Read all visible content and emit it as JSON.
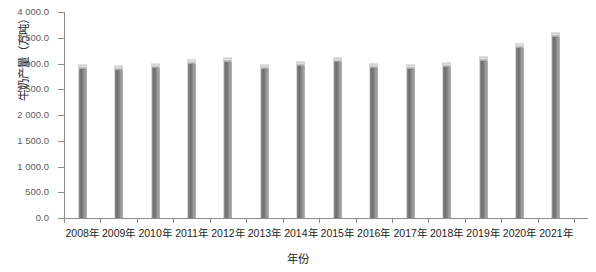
{
  "chart_data": {
    "type": "bar",
    "title": "",
    "xlabel": "年份",
    "ylabel": "牛奶产量（万吨）",
    "categories": [
      "2008年",
      "2009年",
      "2010年",
      "2011年",
      "2012年",
      "2013年",
      "2014年",
      "2015年",
      "2016年",
      "2017年",
      "2018年",
      "2019年",
      "2020年",
      "2021年"
    ],
    "values": [
      3000.0,
      2980.0,
      3010.0,
      3090.0,
      3120.0,
      2990.0,
      3050.0,
      3120.0,
      3010.0,
      3000.0,
      3020.0,
      3150.0,
      3390.0,
      3620.0
    ],
    "ylim": [
      0.0,
      4000.0
    ],
    "y_tick_labels": [
      "4 000.0",
      "3 500.0",
      "3 000.0",
      "2 500.0",
      "2 000.0",
      "1 500.0",
      "1 000.0",
      "500.0",
      "0.0"
    ],
    "y_tick_values": [
      4000.0,
      3500.0,
      3000.0,
      2500.0,
      2000.0,
      1500.0,
      1000.0,
      500.0,
      0.0
    ],
    "grid": false,
    "legend": "none",
    "bar_color": "#7d7d7d",
    "axis_color": "#8c8c8c",
    "text_color": "#231f20"
  }
}
